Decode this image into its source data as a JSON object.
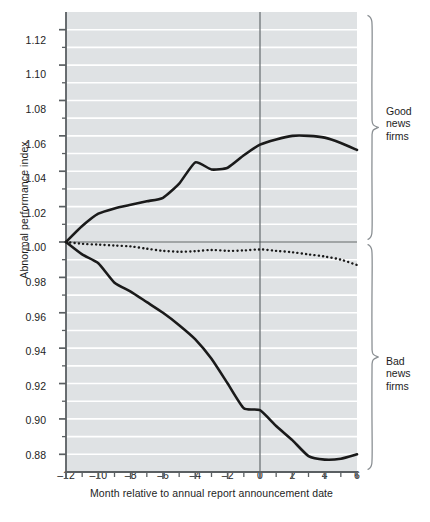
{
  "chart_data": {
    "type": "line",
    "title": "",
    "xlabel": "Month relative to annual report announcement date",
    "ylabel": "Abnormal performance index",
    "xlim": [
      -12,
      6
    ],
    "ylim": [
      0.87,
      1.13
    ],
    "grid": true,
    "grid_orientation": "horizontal",
    "legend_position": "inline-annotations",
    "y_ticks_major": [
      0.88,
      0.9,
      0.92,
      0.94,
      0.96,
      0.98,
      1.0,
      1.02,
      1.04,
      1.06,
      1.08,
      1.1,
      1.12
    ],
    "y_tick_labels": [
      "0.88",
      "0.90",
      "0.92",
      "0.94",
      "0.96",
      "0.98",
      "1.00",
      "1.02",
      "1.04",
      "1.06",
      "1.08",
      "1.10",
      "1.12"
    ],
    "y_ticks_minor": [
      0.87,
      0.89,
      0.91,
      0.93,
      0.95,
      0.97,
      0.99,
      1.01,
      1.03,
      1.05,
      1.07,
      1.09,
      1.11,
      1.13
    ],
    "x_ticks_major": [
      -12,
      -10,
      -8,
      -6,
      -4,
      -2,
      0,
      2,
      4,
      6
    ],
    "x_tick_labels": [
      "–12",
      "–10",
      "–8",
      "–6",
      "–4",
      "–2",
      "0",
      "2",
      "4",
      "6"
    ],
    "x_ticks_minor": [
      -11,
      -9,
      -7,
      -5,
      -3,
      -1,
      1,
      3,
      5
    ],
    "reference_line_x": 0,
    "x": [
      -12,
      -11,
      -10,
      -9,
      -8,
      -7,
      -6,
      -5,
      -4,
      -3,
      -2,
      -1,
      0,
      1,
      2,
      3,
      4,
      5,
      6
    ],
    "series": [
      {
        "name": "Good news firms",
        "style": "solid",
        "color": "#1a1a1a",
        "width": 2.6,
        "values": [
          1.0,
          1.009,
          1.016,
          1.019,
          1.021,
          1.023,
          1.025,
          1.033,
          1.045,
          1.041,
          1.042,
          1.049,
          1.055,
          1.058,
          1.06,
          1.06,
          1.059,
          1.056,
          1.052
        ]
      },
      {
        "name": "Total sample",
        "style": "dotted",
        "color": "#1a1a1a",
        "width": 2.4,
        "values": [
          1.0,
          0.999,
          0.9985,
          0.998,
          0.9975,
          0.9962,
          0.995,
          0.9945,
          0.9948,
          0.9955,
          0.995,
          0.9952,
          0.9958,
          0.995,
          0.9942,
          0.993,
          0.9918,
          0.99,
          0.987
        ]
      },
      {
        "name": "Bad news firms",
        "style": "solid",
        "color": "#1a1a1a",
        "width": 2.6,
        "values": [
          1.0,
          0.993,
          0.988,
          0.977,
          0.972,
          0.966,
          0.96,
          0.953,
          0.945,
          0.934,
          0.92,
          0.906,
          0.905,
          0.896,
          0.888,
          0.879,
          0.877,
          0.8775,
          0.88
        ]
      }
    ],
    "annotations": [
      {
        "name": "total-sample-label",
        "text": "Total sample",
        "x": -5.2,
        "y": 0.989
      },
      {
        "name": "good-news-brace-label",
        "text": "Good\nnews\nfirms",
        "region_y": [
          1.0,
          1.13
        ]
      },
      {
        "name": "bad-news-brace-label",
        "text": "Bad\nnews\nfirms",
        "region_y": [
          0.87,
          1.0
        ]
      }
    ]
  },
  "labels": {
    "good_news_line1": "Good",
    "good_news_line2": "news",
    "good_news_line3": "firms",
    "bad_news_line1": "Bad",
    "bad_news_line2": "news",
    "bad_news_line3": "firms",
    "total_sample": "Total sample"
  },
  "axes": {
    "y_title": "Abnormal performance index",
    "x_title": "Month relative to annual report announcement date"
  },
  "colors": {
    "plot_background": "#dfe2e4",
    "gridline": "#ffffff",
    "line": "#1a1a1a",
    "axis": "#5a5f62",
    "reference_line": "#6d7376",
    "brace": "#8b9094",
    "text": "#1d1d1d",
    "page_background": "#ffffff"
  }
}
